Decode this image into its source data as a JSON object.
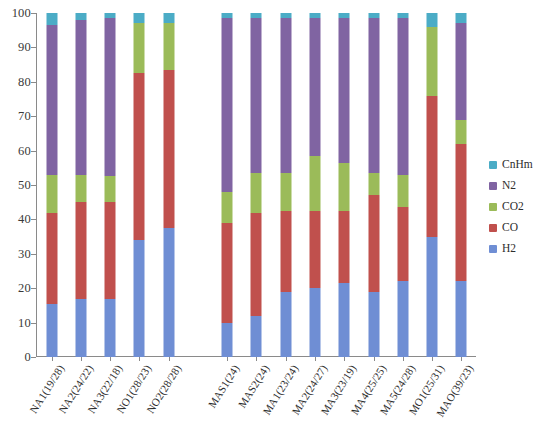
{
  "chart_data": {
    "type": "bar",
    "title": "",
    "xlabel": "",
    "ylabel": "",
    "ylim": [
      0,
      100
    ],
    "ytick_labels": [
      "0",
      "10",
      "20",
      "30",
      "40",
      "50",
      "60",
      "70",
      "80",
      "90",
      "100"
    ],
    "ytick_values": [
      0,
      10,
      20,
      30,
      40,
      50,
      60,
      70,
      80,
      90,
      100
    ],
    "grid": false,
    "legend_position": "right",
    "stacked": true,
    "stack_order_bottom_to_top": [
      "H2",
      "CO",
      "CO2",
      "N2",
      "CnHm"
    ],
    "categories": [
      "NA1(19/28)",
      "NA2(24/22)",
      "NA3(22/18)",
      "NO1(28/23)",
      "NO2(28/28)",
      "MAS1(24)",
      "MAS2(24)",
      "MA1(23/24)",
      "MA2(24/27)",
      "MA3(23/19)",
      "MA4(25/25)",
      "MA5(24/28)",
      "MO1(25/31)",
      "MAO(39/23)"
    ],
    "series": [
      {
        "name": "H2",
        "color": "#6F8ED4",
        "values": [
          15.5,
          17.0,
          17.0,
          34.0,
          37.5,
          10.0,
          12.0,
          19.0,
          20.0,
          21.5,
          19.0,
          22.0,
          35.0,
          22.0
        ]
      },
      {
        "name": "CO",
        "color": "#C0504D",
        "values": [
          26.5,
          28.0,
          28.0,
          48.5,
          46.0,
          29.0,
          30.0,
          23.5,
          22.5,
          21.0,
          28.0,
          21.5,
          41.0,
          40.0
        ]
      },
      {
        "name": "CO2",
        "color": "#9BBB59",
        "values": [
          11.0,
          8.0,
          7.5,
          14.5,
          13.5,
          9.0,
          11.5,
          11.0,
          16.0,
          14.0,
          6.5,
          9.5,
          20.0,
          7.0
        ]
      },
      {
        "name": "N2",
        "color": "#8064A2",
        "values": [
          43.5,
          45.0,
          46.0,
          0.0,
          0.0,
          50.5,
          45.0,
          45.0,
          40.0,
          42.0,
          45.0,
          45.5,
          0.0,
          28.0
        ]
      },
      {
        "name": "CnHm",
        "color": "#4BACC6",
        "values": [
          3.5,
          2.0,
          1.5,
          3.0,
          3.0,
          1.5,
          1.5,
          1.5,
          1.5,
          1.5,
          1.5,
          1.5,
          4.0,
          3.0
        ]
      }
    ],
    "bar_gaps_after_index": [
      4
    ]
  },
  "legend": {
    "items": [
      {
        "label": "CnHm",
        "color": "#4BACC6"
      },
      {
        "label": "N2",
        "color": "#8064A2"
      },
      {
        "label": "CO2",
        "color": "#9BBB59"
      },
      {
        "label": "CO",
        "color": "#C0504D"
      },
      {
        "label": "H2",
        "color": "#6F8ED4"
      }
    ]
  }
}
